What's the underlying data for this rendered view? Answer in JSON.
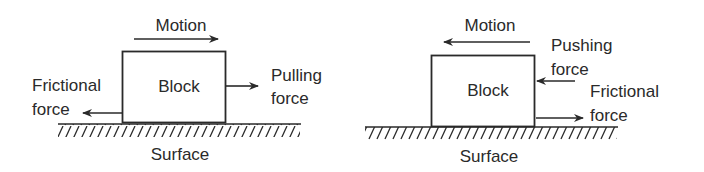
{
  "colors": {
    "ink": "#2a2a2a",
    "background": "#ffffff"
  },
  "left_diagram": {
    "motion_label": "Motion",
    "motion_direction": "right",
    "block_label": "Block",
    "applied_force_label_line1": "Pulling",
    "applied_force_label_line2": "force",
    "friction_label_line1": "Frictional",
    "friction_label_line2": "force",
    "surface_label": "Surface"
  },
  "right_diagram": {
    "motion_label": "Motion",
    "motion_direction": "left",
    "block_label": "Block",
    "applied_force_label_line1": "Pushing",
    "applied_force_label_line2": "force",
    "friction_label_line1": "Frictional",
    "friction_label_line2": "force",
    "surface_label": "Surface"
  }
}
